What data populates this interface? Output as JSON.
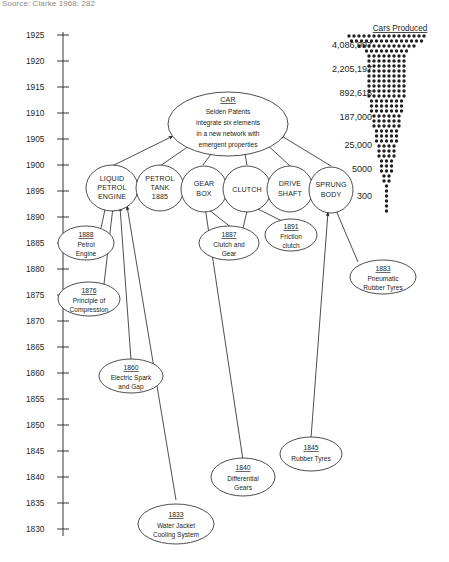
{
  "source_note": "Source: Clarke 1968: 282",
  "axis": {
    "label": "years",
    "ticks": [
      1925,
      1920,
      1915,
      1910,
      1905,
      1900,
      1895,
      1890,
      1885,
      1880,
      1875,
      1870,
      1865,
      1860,
      1855,
      1850,
      1845,
      1840,
      1835,
      1830
    ],
    "min": 1830,
    "max": 1925
  },
  "cars_produced": {
    "title": "Cars Produced",
    "values": [
      "4,086,997",
      "2,205,197",
      "892,618",
      "187,000",
      "25,000",
      "5000",
      "300"
    ]
  },
  "hub": {
    "title": "CAR",
    "lines": [
      "Selden Patents",
      "integrate six elements",
      "in a new network with",
      "emergent properties"
    ]
  },
  "elements": [
    {
      "id": "liquid-petrol-engine",
      "lines": [
        "LIQUID",
        "PETROL",
        "ENGINE"
      ]
    },
    {
      "id": "petrol-tank",
      "lines": [
        "PETROL",
        "TANK",
        "1885"
      ]
    },
    {
      "id": "gear-box",
      "lines": [
        "GEAR",
        "BOX"
      ]
    },
    {
      "id": "clutch",
      "lines": [
        "CLUTCH"
      ]
    },
    {
      "id": "drive-shaft",
      "lines": [
        "DRIVE",
        "SHAFT"
      ]
    },
    {
      "id": "sprung-body",
      "lines": [
        "SPRUNG",
        "BODY"
      ]
    }
  ],
  "antecedents": [
    {
      "id": "petrol-engine",
      "year": "1888",
      "lines": [
        "Petrol",
        "Engine"
      ]
    },
    {
      "id": "principle-of-compression",
      "year": "1876",
      "lines": [
        "Principle of",
        "Compression"
      ]
    },
    {
      "id": "clutch-and-gear",
      "year": "1887",
      "lines": [
        "Clutch and",
        "Gear"
      ]
    },
    {
      "id": "friction-clutch",
      "year": "1891",
      "lines": [
        "Friction",
        "clutch"
      ]
    },
    {
      "id": "pneumatic-rubber-tyres",
      "year": "1883",
      "lines": [
        "Pneumatic",
        "Rubber Tyres"
      ]
    },
    {
      "id": "electric-spark-and-gap",
      "year": "1860",
      "lines": [
        "Electric Spark",
        "and Gap"
      ]
    },
    {
      "id": "rubber-tyres",
      "year": "1845",
      "lines": [
        "Rubber Tyres"
      ]
    },
    {
      "id": "differential-gears",
      "year": "1840",
      "lines": [
        "Differential",
        "Gears"
      ]
    },
    {
      "id": "water-jacket-cooling-system",
      "year": "1833",
      "lines": [
        "Water Jacket",
        "Cooling System"
      ]
    }
  ],
  "chart_data": {
    "type": "bar",
    "title": "Cars Produced",
    "categories": [
      "300",
      "5000",
      "25,000",
      "187,000",
      "892,618",
      "2,205,197",
      "4,086,997"
    ],
    "values": [
      300,
      5000,
      25000,
      187000,
      892618,
      2205197,
      4086997
    ],
    "xlabel": "",
    "ylabel": "years",
    "note": "Isotype-style dot pyramid: car production growth plotted against the 1830-1925 timeline"
  }
}
